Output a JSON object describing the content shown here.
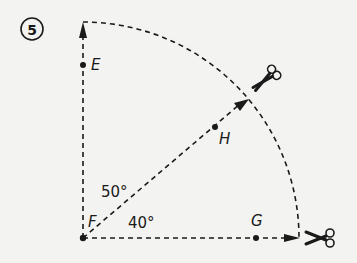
{
  "figure": {
    "number": "5",
    "points": {
      "E": "E",
      "F": "F",
      "G": "G",
      "H": "H"
    },
    "angles": {
      "upper": "50°",
      "lower": "40°"
    },
    "icons": [
      "scissors-icon",
      "scissors-icon"
    ],
    "colors": {
      "ink": "#1a1a1a",
      "background": "#f3f3f1"
    }
  }
}
